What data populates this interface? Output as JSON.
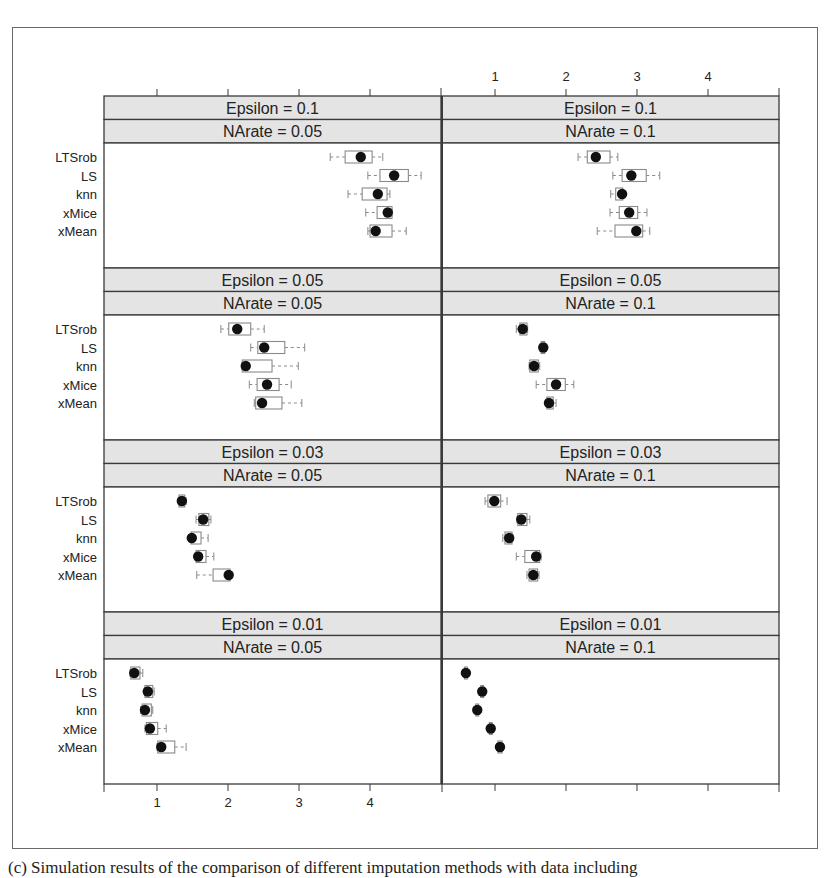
{
  "caption": "(c) Simulation results of the comparison of different imputation methods with data including",
  "colors": {
    "strip_bg": "#e4e4e4",
    "panel_border": "#3a3a3a",
    "box_stroke": "#8a8a8a",
    "median_dot": "#111111",
    "text": "#222222"
  },
  "chart_data": {
    "type": "boxplot",
    "title": "",
    "xlabel": "",
    "ylabel": "",
    "xlim": [
      0.4,
      5.1
    ],
    "x_ticks": [
      1,
      2,
      3,
      4
    ],
    "x_tick_labels": [
      "1",
      "2",
      "3",
      "4"
    ],
    "top_axis_labels_on": "right-column",
    "bottom_axis_labels_on": "left-column",
    "categories": [
      "LTSrob",
      "LS",
      "knn",
      "xMice",
      "xMean"
    ],
    "layout": {
      "columns": 2,
      "rows": 4
    },
    "panels": [
      {
        "epsilon_label": "Epsilon = 0.1",
        "narate_label": "NArate = 0.05",
        "row": 0,
        "col": 0,
        "series": [
          {
            "name": "LTSrob",
            "whisker_low": 3.44,
            "q1": 3.65,
            "median": 3.87,
            "q3": 4.03,
            "whisker_high": 4.18
          },
          {
            "name": "LS",
            "whisker_low": 3.97,
            "q1": 4.14,
            "median": 4.34,
            "q3": 4.54,
            "whisker_high": 4.72
          },
          {
            "name": "knn",
            "whisker_low": 3.69,
            "q1": 3.89,
            "median": 4.11,
            "q3": 4.24,
            "whisker_high": 4.28
          },
          {
            "name": "xMice",
            "whisker_low": 3.94,
            "q1": 4.1,
            "median": 4.25,
            "q3": 4.31,
            "whisker_high": 4.31
          },
          {
            "name": "xMean",
            "whisker_low": 3.97,
            "q1": 4.0,
            "median": 4.08,
            "q3": 4.31,
            "whisker_high": 4.51
          }
        ]
      },
      {
        "epsilon_label": "Epsilon = 0.1",
        "narate_label": "NArate = 0.1",
        "row": 0,
        "col": 1,
        "series": [
          {
            "name": "LTSrob",
            "whisker_low": 2.17,
            "q1": 2.3,
            "median": 2.42,
            "q3": 2.62,
            "whisker_high": 2.73
          },
          {
            "name": "LS",
            "whisker_low": 2.66,
            "q1": 2.79,
            "median": 2.92,
            "q3": 3.13,
            "whisker_high": 3.32
          },
          {
            "name": "knn",
            "whisker_low": 2.63,
            "q1": 2.7,
            "median": 2.79,
            "q3": 2.8,
            "whisker_high": 2.82
          },
          {
            "name": "xMice",
            "whisker_low": 2.62,
            "q1": 2.75,
            "median": 2.89,
            "q3": 3.01,
            "whisker_high": 3.14
          },
          {
            "name": "xMean",
            "whisker_low": 2.44,
            "q1": 2.69,
            "median": 2.99,
            "q3": 3.08,
            "whisker_high": 3.18
          }
        ]
      },
      {
        "epsilon_label": "Epsilon = 0.05",
        "narate_label": "NArate = 0.05",
        "row": 1,
        "col": 0,
        "series": [
          {
            "name": "LTSrob",
            "whisker_low": 1.9,
            "q1": 2.01,
            "median": 2.13,
            "q3": 2.32,
            "whisker_high": 2.51
          },
          {
            "name": "LS",
            "whisker_low": 2.32,
            "q1": 2.42,
            "median": 2.51,
            "q3": 2.8,
            "whisker_high": 3.08
          },
          {
            "name": "knn",
            "whisker_low": 2.2,
            "q1": 2.2,
            "median": 2.25,
            "q3": 2.62,
            "whisker_high": 2.99
          },
          {
            "name": "xMice",
            "whisker_low": 2.3,
            "q1": 2.41,
            "median": 2.55,
            "q3": 2.72,
            "whisker_high": 2.89
          },
          {
            "name": "xMean",
            "whisker_low": 2.37,
            "q1": 2.39,
            "median": 2.48,
            "q3": 2.76,
            "whisker_high": 3.04
          }
        ]
      },
      {
        "epsilon_label": "Epsilon = 0.05",
        "narate_label": "NArate = 0.1",
        "row": 1,
        "col": 1,
        "series": [
          {
            "name": "LTSrob",
            "whisker_low": 1.3,
            "q1": 1.35,
            "median": 1.39,
            "q3": 1.45,
            "whisker_high": 1.46
          },
          {
            "name": "LS",
            "whisker_low": 1.63,
            "q1": 1.65,
            "median": 1.68,
            "q3": 1.7,
            "whisker_high": 1.72
          },
          {
            "name": "knn",
            "whisker_low": 1.48,
            "q1": 1.49,
            "median": 1.55,
            "q3": 1.61,
            "whisker_high": 1.63
          },
          {
            "name": "xMice",
            "whisker_low": 1.58,
            "q1": 1.73,
            "median": 1.86,
            "q3": 1.99,
            "whisker_high": 2.11
          },
          {
            "name": "xMean",
            "whisker_low": 1.72,
            "q1": 1.73,
            "median": 1.76,
            "q3": 1.82,
            "whisker_high": 1.86
          }
        ]
      },
      {
        "epsilon_label": "Epsilon = 0.03",
        "narate_label": "NArate = 0.05",
        "row": 2,
        "col": 0,
        "series": [
          {
            "name": "LTSrob",
            "whisker_low": 1.3,
            "q1": 1.31,
            "median": 1.35,
            "q3": 1.39,
            "whisker_high": 1.41
          },
          {
            "name": "LS",
            "whisker_low": 1.55,
            "q1": 1.59,
            "median": 1.65,
            "q3": 1.73,
            "whisker_high": 1.76
          },
          {
            "name": "knn",
            "whisker_low": 1.48,
            "q1": 1.48,
            "median": 1.49,
            "q3": 1.62,
            "whisker_high": 1.72
          },
          {
            "name": "xMice",
            "whisker_low": 1.55,
            "q1": 1.55,
            "median": 1.58,
            "q3": 1.69,
            "whisker_high": 1.8
          },
          {
            "name": "xMean",
            "whisker_low": 1.56,
            "q1": 1.79,
            "median": 2.01,
            "q3": 2.03,
            "whisker_high": 2.03
          }
        ]
      },
      {
        "epsilon_label": "Epsilon = 0.03",
        "narate_label": "NArate = 0.1",
        "row": 2,
        "col": 1,
        "series": [
          {
            "name": "LTSrob",
            "whisker_low": 0.86,
            "q1": 0.9,
            "median": 0.99,
            "q3": 1.08,
            "whisker_high": 1.17
          },
          {
            "name": "LS",
            "whisker_low": 1.31,
            "q1": 1.32,
            "median": 1.37,
            "q3": 1.45,
            "whisker_high": 1.49
          },
          {
            "name": "knn",
            "whisker_low": 1.11,
            "q1": 1.14,
            "median": 1.2,
            "q3": 1.24,
            "whisker_high": 1.25
          },
          {
            "name": "xMice",
            "whisker_low": 1.3,
            "q1": 1.42,
            "median": 1.58,
            "q3": 1.63,
            "whisker_high": 1.65
          },
          {
            "name": "xMean",
            "whisker_low": 1.45,
            "q1": 1.48,
            "median": 1.54,
            "q3": 1.6,
            "whisker_high": 1.62
          }
        ]
      },
      {
        "epsilon_label": "Epsilon = 0.01",
        "narate_label": "NArate = 0.05",
        "row": 3,
        "col": 0,
        "series": [
          {
            "name": "LTSrob",
            "whisker_low": 0.62,
            "q1": 0.63,
            "median": 0.68,
            "q3": 0.76,
            "whisker_high": 0.8
          },
          {
            "name": "LS",
            "whisker_low": 0.82,
            "q1": 0.83,
            "median": 0.87,
            "q3": 0.94,
            "whisker_high": 0.96
          },
          {
            "name": "knn",
            "whisker_low": 0.77,
            "q1": 0.79,
            "median": 0.83,
            "q3": 0.92,
            "whisker_high": 0.94
          },
          {
            "name": "xMice",
            "whisker_low": 0.83,
            "q1": 0.85,
            "median": 0.9,
            "q3": 1.01,
            "whisker_high": 1.13
          },
          {
            "name": "xMean",
            "whisker_low": 1.0,
            "q1": 1.01,
            "median": 1.06,
            "q3": 1.25,
            "whisker_high": 1.41
          }
        ]
      },
      {
        "epsilon_label": "Epsilon = 0.01",
        "narate_label": "NArate = 0.1",
        "row": 3,
        "col": 1,
        "series": [
          {
            "name": "LTSrob",
            "whisker_low": 0.56,
            "q1": 0.57,
            "median": 0.59,
            "q3": 0.61,
            "whisker_high": 0.62
          },
          {
            "name": "LS",
            "whisker_low": 0.79,
            "q1": 0.8,
            "median": 0.82,
            "q3": 0.84,
            "whisker_high": 0.85
          },
          {
            "name": "knn",
            "whisker_low": 0.72,
            "q1": 0.73,
            "median": 0.75,
            "q3": 0.77,
            "whisker_high": 0.78
          },
          {
            "name": "xMice",
            "whisker_low": 0.91,
            "q1": 0.92,
            "median": 0.94,
            "q3": 0.96,
            "whisker_high": 0.97
          },
          {
            "name": "xMean",
            "whisker_low": 1.03,
            "q1": 1.04,
            "median": 1.07,
            "q3": 1.1,
            "whisker_high": 1.12
          }
        ]
      }
    ]
  }
}
